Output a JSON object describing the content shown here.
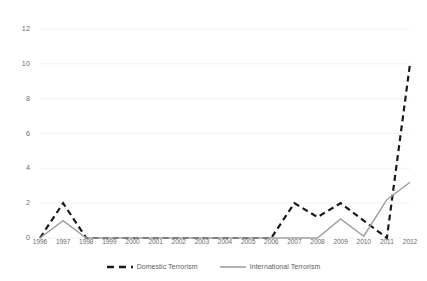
{
  "chart_data": {
    "type": "line",
    "title": "",
    "subtitle": "",
    "xlabel": "",
    "ylabel": "",
    "categories": [
      "1996",
      "1997",
      "1998",
      "1999",
      "2000",
      "2001",
      "2002",
      "2003",
      "2004",
      "2005",
      "2006",
      "2007",
      "2008",
      "2009",
      "2010",
      "2011",
      "2012"
    ],
    "series": [
      {
        "name": "Domestic Terrorism",
        "style": "dashed",
        "color": "#1a1a1a",
        "values": [
          0,
          2,
          0,
          0,
          0,
          0,
          0,
          0,
          0,
          0,
          0,
          2,
          1.2,
          2,
          1,
          0,
          10
        ]
      },
      {
        "name": "International Terrorism",
        "style": "solid",
        "color": "#a0a0a0",
        "values": [
          0,
          1,
          0,
          0,
          0,
          0,
          0,
          0,
          0,
          0,
          0,
          0,
          0,
          1.1,
          0.1,
          2.2,
          3.2
        ]
      }
    ],
    "yticks": [
      0,
      2,
      4,
      6,
      8,
      10,
      12
    ],
    "ylim": [
      0,
      12
    ],
    "xlim": [
      "1996",
      "2012"
    ],
    "grid": true,
    "grid_color": "#f2f2f2",
    "legend_position": "bottom"
  },
  "legend": {
    "entries": [
      {
        "label": "Domestic Terrorism"
      },
      {
        "label": "International Terrorism"
      }
    ]
  }
}
